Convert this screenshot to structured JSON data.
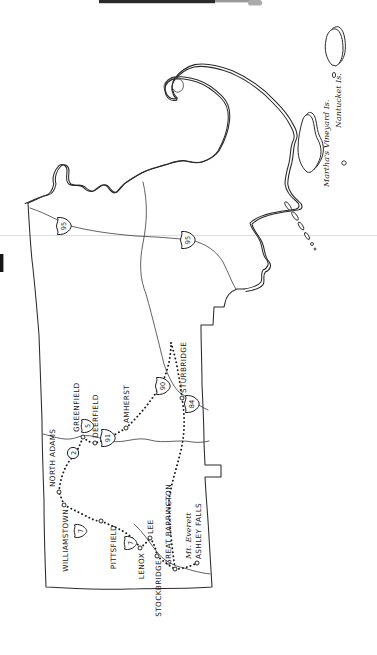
{
  "colors": {
    "ink": "#2b2b2b",
    "paper": "#ffffff"
  },
  "map": {
    "towns": [
      {
        "name": "WILLIAMSTOWN",
        "x": 146,
        "y": 68,
        "anchor": "end",
        "dot": {
          "x": 150,
          "y": 64
        }
      },
      {
        "name": "NORTH ADAMS",
        "x": 168,
        "y": 55,
        "anchor": "start",
        "dot": {
          "x": 163,
          "y": 59
        }
      },
      {
        "name": "GREENFIELD",
        "x": 223,
        "y": 79,
        "anchor": "start",
        "dot": {
          "x": 218,
          "y": 83
        }
      },
      {
        "name": "DEERFIELD",
        "x": 217,
        "y": 98,
        "anchor": "start",
        "dot": {
          "x": 212,
          "y": 95
        }
      },
      {
        "name": "AMHERST",
        "x": 232,
        "y": 129,
        "anchor": "start",
        "dot": {
          "x": 227,
          "y": 126
        }
      },
      {
        "name": "STURBRIDGE",
        "x": 262,
        "y": 186,
        "anchor": "start",
        "dot": {
          "x": 257,
          "y": 182
        }
      },
      {
        "name": "PITTSFIELD",
        "x": 130,
        "y": 116,
        "anchor": "end",
        "dot": {
          "x": 134,
          "y": 101
        }
      },
      {
        "name": "LENOX",
        "x": 102,
        "y": 144,
        "anchor": "end",
        "dot": {
          "x": 107,
          "y": 140
        }
      },
      {
        "name": "LEE",
        "x": 121,
        "y": 153,
        "anchor": "start",
        "dot": {
          "x": 117,
          "y": 150
        }
      },
      {
        "name": "STOCKBRIDGE",
        "x": 95,
        "y": 161,
        "anchor": "end",
        "dot": {
          "x": 99,
          "y": 157
        }
      },
      {
        "name": "GREAT BARRINGTON",
        "x": 90,
        "y": 171,
        "anchor": "start",
        "dot": {
          "x": 86,
          "y": 175
        }
      },
      {
        "name": "ASHLEY FALLS",
        "x": 96,
        "y": 201,
        "anchor": "start",
        "dot": {
          "x": 92,
          "y": 197
        }
      }
    ],
    "features": [
      {
        "name": "Mt. Everett",
        "x": 96,
        "y": 191,
        "anchor": "start"
      },
      {
        "name": "Martha's Vineyard Is.",
        "x": 468,
        "y": 329,
        "anchor": "start"
      },
      {
        "name": "Nantucket Is.",
        "x": 527,
        "y": 341,
        "anchor": "start"
      }
    ],
    "shields": [
      {
        "type": "interstate",
        "number": "95",
        "x": 429,
        "y": 63
      },
      {
        "type": "interstate",
        "number": "95",
        "x": 415,
        "y": 187
      },
      {
        "type": "interstate",
        "number": "91",
        "x": 217,
        "y": 107
      },
      {
        "type": "interstate",
        "number": "90",
        "x": 269,
        "y": 162
      },
      {
        "type": "interstate",
        "number": "84",
        "x": 251,
        "y": 191
      },
      {
        "type": "us",
        "number": "7",
        "x": 124,
        "y": 80
      },
      {
        "type": "us",
        "number": "7",
        "x": 112,
        "y": 130
      },
      {
        "type": "us",
        "number": "5",
        "x": 229,
        "y": 87
      },
      {
        "type": "state",
        "number": "2",
        "x": 202,
        "y": 73
      }
    ]
  }
}
